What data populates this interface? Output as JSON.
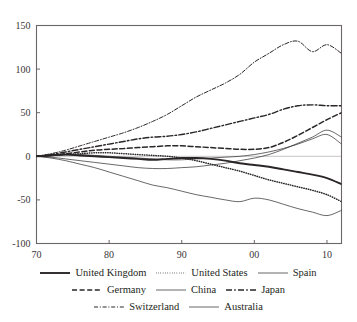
{
  "chart_data": {
    "type": "line",
    "title": "",
    "xlabel": "",
    "ylabel": "",
    "xlim": [
      1970,
      2012
    ],
    "ylim": [
      -100,
      150
    ],
    "grid": false,
    "legend_position": "bottom",
    "y_ticks": [
      150,
      100,
      50,
      0,
      -50,
      -100
    ],
    "y_tick_labels": [
      "150",
      "100",
      "50",
      "0",
      "-50",
      "-100"
    ],
    "x_ticks": [
      1970,
      1980,
      1990,
      2000,
      2010
    ],
    "x_tick_labels": [
      "70",
      "80",
      "90",
      "00",
      "10"
    ],
    "x": [
      1970,
      1972,
      1974,
      1976,
      1978,
      1980,
      1982,
      1984,
      1986,
      1988,
      1990,
      1992,
      1994,
      1996,
      1998,
      2000,
      2002,
      2004,
      2006,
      2008,
      2010,
      2012
    ],
    "series": [
      {
        "name": "United Kingdom",
        "style": "solid-thick",
        "values": [
          0,
          1,
          2,
          1,
          0,
          -1,
          -2,
          -3,
          -4,
          -3,
          -2,
          -2,
          -3,
          -5,
          -8,
          -10,
          -12,
          -15,
          -18,
          -21,
          -25,
          -32
        ]
      },
      {
        "name": "United States",
        "style": "dotted",
        "values": [
          0,
          1,
          2,
          3,
          4,
          4,
          3,
          2,
          1,
          0,
          -2,
          -5,
          -9,
          -13,
          -17,
          -22,
          -27,
          -31,
          -35,
          -39,
          -44,
          -52
        ]
      },
      {
        "name": "Spain",
        "style": "solid-thin",
        "values": [
          0,
          -2,
          -5,
          -9,
          -13,
          -18,
          -23,
          -28,
          -33,
          -36,
          -40,
          -44,
          -47,
          -50,
          -52,
          -48,
          -50,
          -55,
          -60,
          -64,
          -68,
          -62
        ]
      },
      {
        "name": "Germany",
        "style": "dashed",
        "values": [
          0,
          1,
          3,
          5,
          7,
          8,
          9,
          10,
          11,
          12,
          12,
          11,
          10,
          9,
          8,
          8,
          10,
          16,
          24,
          33,
          42,
          50
        ]
      },
      {
        "name": "China",
        "style": "solid-thin",
        "values": [
          0,
          -1,
          -3,
          -5,
          -7,
          -9,
          -11,
          -13,
          -14,
          -14,
          -13,
          -12,
          -10,
          -8,
          -5,
          -2,
          2,
          8,
          15,
          22,
          30,
          22
        ]
      },
      {
        "name": "Japan",
        "style": "dash-dot",
        "values": [
          0,
          2,
          5,
          8,
          11,
          14,
          17,
          20,
          22,
          23,
          25,
          28,
          32,
          36,
          40,
          44,
          48,
          54,
          58,
          59,
          58,
          58
        ]
      },
      {
        "name": "Switzerland",
        "style": "dash-dot-fine",
        "values": [
          0,
          3,
          7,
          12,
          17,
          22,
          27,
          33,
          40,
          48,
          58,
          68,
          76,
          84,
          94,
          108,
          118,
          128,
          132,
          120,
          128,
          118
        ]
      },
      {
        "name": "Australia",
        "style": "solid-thin",
        "values": [
          0,
          1,
          2,
          2,
          1,
          0,
          -1,
          -2,
          -3,
          -4,
          -4,
          -3,
          -2,
          -1,
          0,
          2,
          5,
          9,
          14,
          20,
          25,
          14
        ]
      }
    ]
  },
  "legend": {
    "rows": [
      [
        {
          "label": "United Kingdom",
          "style": "solid-thick"
        },
        {
          "label": "United States",
          "style": "dotted"
        },
        {
          "label": "Spain",
          "style": "solid-thin"
        }
      ],
      [
        {
          "label": "Germany",
          "style": "dashed"
        },
        {
          "label": "China",
          "style": "solid-thin"
        },
        {
          "label": "Japan",
          "style": "dash-dot"
        }
      ],
      [
        {
          "label": "Switzerland",
          "style": "dash-dot-fine"
        },
        {
          "label": "Australia",
          "style": "solid-thin"
        }
      ]
    ]
  },
  "colors": {
    "axis": "#6b6668",
    "line": "#2a2628",
    "background": "#ffffff",
    "zero_line": "#b9b5b6"
  }
}
